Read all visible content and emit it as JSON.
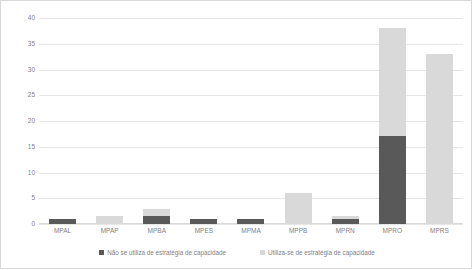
{
  "chart_data": {
    "type": "bar",
    "stacked": true,
    "title": "",
    "xlabel": "",
    "ylabel": "",
    "ylim": [
      0,
      40
    ],
    "yticks": [
      0,
      5,
      10,
      15,
      20,
      25,
      30,
      35,
      40
    ],
    "grid": true,
    "legend_position": "bottom",
    "categories": [
      "MPAL",
      "MPAP",
      "MPBA",
      "MPES",
      "MPMA",
      "MPPB",
      "MPRN",
      "MPRO",
      "MPRS"
    ],
    "series": [
      {
        "name": "Não se utiliza de estratégia de capacidade",
        "color": "#595959",
        "values": [
          1,
          0,
          1.5,
          1,
          1,
          0,
          1,
          17,
          0
        ]
      },
      {
        "name": "Utiliza-se de estratégia de capacidade",
        "color": "#d9d9d9",
        "values": [
          0,
          1.5,
          1.5,
          0,
          0,
          6,
          0.5,
          21,
          33
        ]
      }
    ]
  },
  "axis": {
    "y_tick_labels": [
      "0",
      "5",
      "10",
      "15",
      "20",
      "25",
      "30",
      "35",
      "40"
    ],
    "x_tick_labels": [
      "MPAL",
      "MPAP",
      "MPBA",
      "MPES",
      "MPMA",
      "MPPB",
      "MPRN",
      "MPRO",
      "MPRS"
    ]
  },
  "legend": {
    "entries": [
      {
        "label": "Não se utiliza de estratégia de capacidade",
        "color": "#595959"
      },
      {
        "label": "Utiliza-se de estratégia de capacidade",
        "color": "#d9d9d9"
      }
    ]
  },
  "colors": {
    "dark": "#595959",
    "light": "#d9d9d9",
    "grid": "#e6e6e6",
    "text": "#7f7f7f",
    "border": "#d9d9d9"
  }
}
